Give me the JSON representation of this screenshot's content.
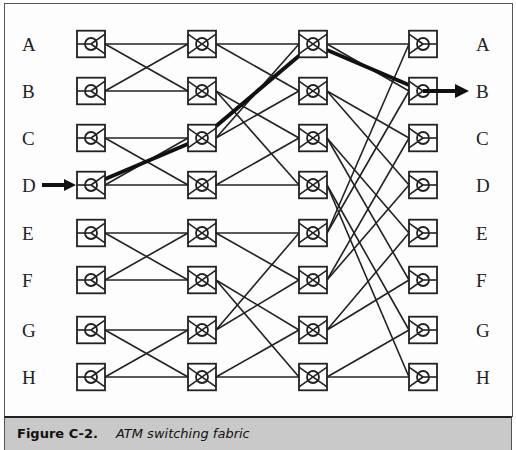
{
  "figure": {
    "number_label": "Figure C-2.",
    "title": "ATM switching fabric"
  },
  "inputs": [
    "A",
    "B",
    "C",
    "D",
    "E",
    "F",
    "G",
    "H"
  ],
  "outputs": [
    "A",
    "B",
    "C",
    "D",
    "E",
    "F",
    "G",
    "H"
  ],
  "highlighted_path": {
    "input": "D",
    "output": "B",
    "route": [
      [
        0,
        3
      ],
      [
        1,
        2
      ],
      [
        2,
        0
      ],
      [
        3,
        1
      ]
    ]
  },
  "layout": {
    "rows_y": [
      44,
      91,
      138,
      185,
      233,
      280,
      330,
      377
    ],
    "cols_x": [
      91,
      202,
      313,
      423
    ],
    "box_size": 28
  },
  "connections": {
    "stage1_to_stage2": [
      [
        0,
        0
      ],
      [
        0,
        1
      ],
      [
        1,
        0
      ],
      [
        1,
        1
      ],
      [
        2,
        2
      ],
      [
        2,
        3
      ],
      [
        3,
        2
      ],
      [
        3,
        3
      ],
      [
        4,
        4
      ],
      [
        4,
        5
      ],
      [
        5,
        4
      ],
      [
        5,
        5
      ],
      [
        6,
        6
      ],
      [
        6,
        7
      ],
      [
        7,
        6
      ],
      [
        7,
        7
      ]
    ],
    "stage2_to_stage3": [
      [
        0,
        0
      ],
      [
        0,
        1
      ],
      [
        1,
        2
      ],
      [
        1,
        3
      ],
      [
        2,
        0
      ],
      [
        2,
        1
      ],
      [
        3,
        2
      ],
      [
        3,
        3
      ],
      [
        4,
        4
      ],
      [
        4,
        5
      ],
      [
        5,
        6
      ],
      [
        5,
        7
      ],
      [
        6,
        4
      ],
      [
        6,
        5
      ],
      [
        7,
        6
      ],
      [
        7,
        7
      ]
    ],
    "stage3_to_stage4": [
      [
        0,
        0
      ],
      [
        0,
        1
      ],
      [
        1,
        2
      ],
      [
        1,
        3
      ],
      [
        2,
        4
      ],
      [
        2,
        5
      ],
      [
        3,
        6
      ],
      [
        3,
        7
      ],
      [
        4,
        0
      ],
      [
        4,
        1
      ],
      [
        5,
        2
      ],
      [
        5,
        3
      ],
      [
        6,
        4
      ],
      [
        6,
        5
      ],
      [
        7,
        6
      ],
      [
        7,
        7
      ]
    ]
  },
  "colors": {
    "line": "#222222",
    "caption_band": "#c9c9c9"
  }
}
